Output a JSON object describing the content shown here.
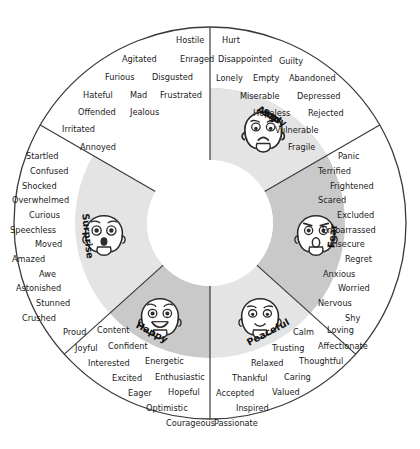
{
  "geometry": {
    "cx": 210,
    "cy": 223,
    "r_outer": 196,
    "r_mid": 135,
    "r_inner": 63
  },
  "colors": {
    "outline": "#3b3b3b",
    "ring_dark": "#c9c9c9",
    "ring_light": "#e4e4e4",
    "center": "#ffffff",
    "text": "#1b1b1b",
    "face_fill": "#ffffff",
    "face_line": "#2c2c2c"
  },
  "sectors": [
    {
      "key": "angry",
      "core_label": "Angry",
      "face": "angry-face",
      "shade": "dark",
      "a0": -90,
      "a1": -30,
      "core_angle": -60,
      "words": [
        "Hostile",
        "Agitated",
        "Enraged",
        "Furious",
        "Disgusted",
        "Hateful",
        "Mad",
        "Frustrated",
        "Offended",
        "Jealous",
        "Irritated",
        "Annoyed"
      ],
      "rows": [
        [
          "Hostile"
        ],
        [
          "Agitated",
          "Enraged"
        ],
        [
          "Furious",
          "Disgusted"
        ],
        [
          "Hateful",
          "Mad",
          "Frustrated"
        ],
        [
          "Offended",
          "Jealous"
        ],
        [
          "Irritated"
        ],
        [
          "Annoyed"
        ]
      ]
    },
    {
      "key": "sad",
      "core_label": "Sad",
      "face": "sad-face",
      "shade": "light",
      "a0": -90,
      "a1": -30,
      "core_angle": -60,
      "words": [
        "Hurt",
        "Disappointed",
        "Guilty",
        "Lonely",
        "Empty",
        "Abandoned",
        "Miserable",
        "Depressed",
        "Hopeless",
        "Rejected",
        "Vulnerable",
        "Fragile"
      ],
      "rows": [
        [
          "Hurt"
        ],
        [
          "Disappointed",
          "Guilty"
        ],
        [
          "Lonely",
          "Empty",
          "Abandoned"
        ],
        [
          "Miserable",
          "Depressed"
        ],
        [
          "Hopeless",
          "Rejected"
        ],
        [
          "Vulnerable"
        ],
        [
          "Fragile"
        ]
      ]
    },
    {
      "key": "fear",
      "core_label": "Fear",
      "face": "fear-face",
      "shade": "dark",
      "a0": -30,
      "a1": 42,
      "core_angle": 6,
      "words": [
        "Panic",
        "Terrified",
        "Frightened",
        "Scared",
        "Excluded",
        "Embarrassed",
        "Insecure",
        "Regret",
        "Anxious",
        "Worried",
        "Nervous",
        "Shy"
      ],
      "rows": [
        [
          "Panic"
        ],
        [
          "Terrified"
        ],
        [
          "Frightened"
        ],
        [
          "Scared"
        ],
        [
          "Excluded"
        ],
        [
          "Embarrassed"
        ],
        [
          "Insecure"
        ],
        [
          "Regret"
        ],
        [
          "Anxious"
        ],
        [
          "Worried"
        ],
        [
          "Nervous"
        ],
        [
          "Shy"
        ]
      ]
    },
    {
      "key": "peaceful",
      "core_label": "Peaceful",
      "face": "peaceful-face",
      "shade": "light",
      "a0": 42,
      "a1": 90,
      "core_angle": 62,
      "words": [
        "Calm",
        "Loving",
        "Trusting",
        "Affectionate",
        "Relaxed",
        "Thoughtful",
        "Thankful",
        "Caring",
        "Accepted",
        "Valued",
        "Inspired",
        "Passionate"
      ],
      "rows": [
        [
          "Calm",
          "Loving"
        ],
        [
          "Trusting",
          "Affectionate"
        ],
        [
          "Relaxed",
          "Thoughtful"
        ],
        [
          "Thankful",
          "Caring"
        ],
        [
          "Accepted",
          "Valued"
        ],
        [
          "Inspired"
        ],
        [
          "Passionate"
        ]
      ]
    },
    {
      "key": "happy",
      "core_label": "Happy",
      "face": "happy-face",
      "shade": "dark",
      "a0": 90,
      "a1": 138,
      "core_angle": 118,
      "words": [
        "Proud",
        "Content",
        "Joyful",
        "Confident",
        "Interested",
        "Energetic",
        "Excited",
        "Enthusiastic",
        "Eager",
        "Hopeful",
        "Optimistic",
        "Courageous"
      ],
      "rows": [
        [
          "Proud",
          "Content"
        ],
        [
          "Joyful",
          "Confident"
        ],
        [
          "Interested",
          "Energetic"
        ],
        [
          "Excited",
          "Enthusiastic"
        ],
        [
          "Eager",
          "Hopeful"
        ],
        [
          "Optimistic"
        ],
        [
          "Courageous"
        ]
      ]
    },
    {
      "key": "surprise",
      "core_label": "Surprise",
      "face": "surprise-face",
      "shade": "light",
      "a0": 138,
      "a1": 210,
      "core_angle": 174,
      "words": [
        "Startled",
        "Confused",
        "Shocked",
        "Overwhelmed",
        "Curious",
        "Speechless",
        "Moved",
        "Amazed",
        "Awe",
        "Astonished",
        "Stunned",
        "Crushed"
      ],
      "rows": [
        [
          "Startled"
        ],
        [
          "Confused"
        ],
        [
          "Shocked"
        ],
        [
          "Overwhelmed"
        ],
        [
          "Curious"
        ],
        [
          "Speechless"
        ],
        [
          "Moved"
        ],
        [
          "Amazed"
        ],
        [
          "Awe"
        ],
        [
          "Astonished"
        ],
        [
          "Stunned"
        ],
        [
          "Crushed"
        ]
      ]
    }
  ],
  "word_positions": {
    "angry": [
      {
        "t": "Hostile",
        "x": 176,
        "y": 36
      },
      {
        "t": "Agitated",
        "x": 122,
        "y": 55
      },
      {
        "t": "Enraged",
        "x": 180,
        "y": 55
      },
      {
        "t": "Furious",
        "x": 105,
        "y": 73
      },
      {
        "t": "Disgusted",
        "x": 152,
        "y": 73
      },
      {
        "t": "Hateful",
        "x": 83,
        "y": 91
      },
      {
        "t": "Mad",
        "x": 130,
        "y": 91
      },
      {
        "t": "Frustrated",
        "x": 160,
        "y": 91
      },
      {
        "t": "Offended",
        "x": 78,
        "y": 108
      },
      {
        "t": "Jealous",
        "x": 130,
        "y": 108
      },
      {
        "t": "Irritated",
        "x": 62,
        "y": 125
      },
      {
        "t": "Annoyed",
        "x": 80,
        "y": 143
      }
    ],
    "sad": [
      {
        "t": "Hurt",
        "x": 222,
        "y": 36
      },
      {
        "t": "Disappointed",
        "x": 218,
        "y": 55
      },
      {
        "t": "Guilty",
        "x": 279,
        "y": 57
      },
      {
        "t": "Lonely",
        "x": 216,
        "y": 74
      },
      {
        "t": "Empty",
        "x": 253,
        "y": 74
      },
      {
        "t": "Abandoned",
        "x": 289,
        "y": 74
      },
      {
        "t": "Miserable",
        "x": 240,
        "y": 92
      },
      {
        "t": "Depressed",
        "x": 297,
        "y": 92
      },
      {
        "t": "Hopeless",
        "x": 253,
        "y": 109
      },
      {
        "t": "Rejected",
        "x": 308,
        "y": 109
      },
      {
        "t": "Vulnerable",
        "x": 275,
        "y": 126
      },
      {
        "t": "Fragile",
        "x": 288,
        "y": 143
      }
    ],
    "fear": [
      {
        "t": "Panic",
        "x": 338,
        "y": 152
      },
      {
        "t": "Terrified",
        "x": 318,
        "y": 167
      },
      {
        "t": "Frightened",
        "x": 330,
        "y": 182
      },
      {
        "t": "Scared",
        "x": 318,
        "y": 196
      },
      {
        "t": "Excluded",
        "x": 337,
        "y": 211
      },
      {
        "t": "Embarrassed",
        "x": 322,
        "y": 226
      },
      {
        "t": "Insecure",
        "x": 330,
        "y": 240
      },
      {
        "t": "Regret",
        "x": 345,
        "y": 255
      },
      {
        "t": "Anxious",
        "x": 323,
        "y": 270
      },
      {
        "t": "Worried",
        "x": 338,
        "y": 284
      },
      {
        "t": "Nervous",
        "x": 318,
        "y": 299
      },
      {
        "t": "Shy",
        "x": 345,
        "y": 314
      }
    ],
    "peaceful": [
      {
        "t": "Calm",
        "x": 293,
        "y": 328
      },
      {
        "t": "Loving",
        "x": 327,
        "y": 326
      },
      {
        "t": "Trusting",
        "x": 272,
        "y": 344
      },
      {
        "t": "Affectionate",
        "x": 318,
        "y": 342
      },
      {
        "t": "Relaxed",
        "x": 251,
        "y": 359
      },
      {
        "t": "Thoughtful",
        "x": 299,
        "y": 357
      },
      {
        "t": "Thankful",
        "x": 232,
        "y": 374
      },
      {
        "t": "Caring",
        "x": 284,
        "y": 373
      },
      {
        "t": "Accepted",
        "x": 216,
        "y": 389
      },
      {
        "t": "Valued",
        "x": 272,
        "y": 388
      },
      {
        "t": "Inspired",
        "x": 236,
        "y": 404
      },
      {
        "t": "Passionate",
        "x": 214,
        "y": 419
      }
    ],
    "happy": [
      {
        "t": "Proud",
        "x": 63,
        "y": 328
      },
      {
        "t": "Content",
        "x": 97,
        "y": 326
      },
      {
        "t": "Joyful",
        "x": 75,
        "y": 344
      },
      {
        "t": "Confident",
        "x": 108,
        "y": 342
      },
      {
        "t": "Interested",
        "x": 88,
        "y": 359
      },
      {
        "t": "Energetic",
        "x": 145,
        "y": 357
      },
      {
        "t": "Excited",
        "x": 112,
        "y": 374
      },
      {
        "t": "Enthusiastic",
        "x": 155,
        "y": 373
      },
      {
        "t": "Eager",
        "x": 128,
        "y": 389
      },
      {
        "t": "Hopeful",
        "x": 168,
        "y": 388
      },
      {
        "t": "Optimistic",
        "x": 146,
        "y": 404
      },
      {
        "t": "Courageous",
        "x": 166,
        "y": 419
      }
    ],
    "surprise": [
      {
        "t": "Startled",
        "x": 26,
        "y": 152
      },
      {
        "t": "Confused",
        "x": 30,
        "y": 167
      },
      {
        "t": "Shocked",
        "x": 22,
        "y": 182
      },
      {
        "t": "Overwhelmed",
        "x": 12,
        "y": 196
      },
      {
        "t": "Curious",
        "x": 29,
        "y": 211
      },
      {
        "t": "Speechless",
        "x": 10,
        "y": 226
      },
      {
        "t": "Moved",
        "x": 35,
        "y": 240
      },
      {
        "t": "Amazed",
        "x": 12,
        "y": 255
      },
      {
        "t": "Awe",
        "x": 39,
        "y": 270
      },
      {
        "t": "Astonished",
        "x": 16,
        "y": 284
      },
      {
        "t": "Stunned",
        "x": 36,
        "y": 299
      },
      {
        "t": "Crushed",
        "x": 22,
        "y": 314
      }
    ]
  }
}
